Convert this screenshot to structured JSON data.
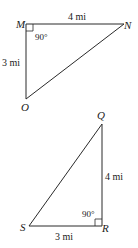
{
  "diagram": {
    "triangles": [
      {
        "name": "MNO",
        "vertices": {
          "M": "M",
          "N": "N",
          "O": "O"
        },
        "right_angle_vertex": "M",
        "angle_label": "90°",
        "sides": {
          "MN": "4 mi",
          "MO": "3 mi"
        }
      },
      {
        "name": "QRS",
        "vertices": {
          "Q": "Q",
          "R": "R",
          "S": "S"
        },
        "right_angle_vertex": "R",
        "angle_label": "90°",
        "sides": {
          "QR": "4 mi",
          "SR": "3 mi"
        }
      }
    ]
  }
}
